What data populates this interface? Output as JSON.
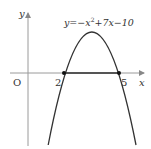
{
  "diagram": {
    "type": "function-graph",
    "equation_label": {
      "prefix": "y=−x",
      "exponent": "2",
      "suffix": "+7x−10"
    },
    "axes": {
      "x_label": "x",
      "y_label": "y",
      "origin_label": "O"
    },
    "roots": [
      {
        "x": 2,
        "label": "2"
      },
      {
        "x": 5,
        "label": "5"
      }
    ],
    "vertex": {
      "x": 3.5,
      "y": 2.25
    },
    "highlighted_interval": [
      2,
      5
    ],
    "colors": {
      "curve": "#333333",
      "axis": "#999999",
      "segment": "#555555",
      "text": "#333333"
    }
  }
}
